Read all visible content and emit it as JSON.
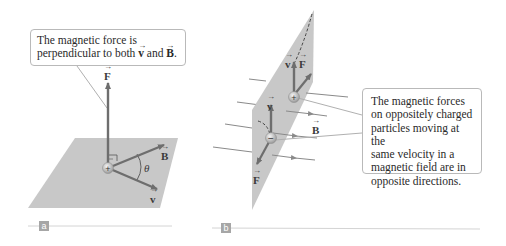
{
  "panel_a": {
    "callout": {
      "line1": "The magnetic force is",
      "line2_pre": "perpendicular to both ",
      "v": "v",
      "and": " and ",
      "B": "B",
      "period": "."
    },
    "labels": {
      "F": "F",
      "B": "B",
      "v": "v",
      "theta": "θ"
    },
    "charge": "+",
    "tag": "a"
  },
  "panel_b": {
    "callout": {
      "lines": [
        "The magnetic forces",
        "on oppositely charged",
        "particles moving at the",
        "same velocity in a",
        "magnetic field are in",
        "opposite directions."
      ]
    },
    "labels": {
      "v_pos": "v",
      "F_pos": "F",
      "v_neg": "v",
      "F_neg": "F",
      "B": "B"
    },
    "charges": {
      "positive": "+",
      "negative": "−"
    },
    "tag": "b"
  },
  "colors": {
    "plane": "#c8c8c8",
    "arrow": "#6e6e6e",
    "field_line": "#8a8a8a",
    "callout_border": "#b9b9b9",
    "tag_bg": "#a6a6a6",
    "rule": "#d4d4d4"
  }
}
